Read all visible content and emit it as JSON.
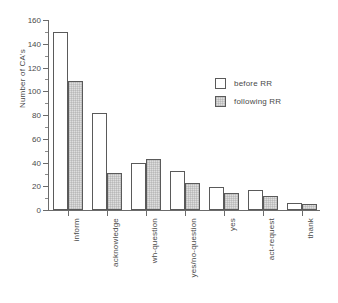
{
  "chart_data": {
    "type": "bar",
    "title": "",
    "xlabel": "",
    "ylabel": "Number of CA's",
    "ylim": [
      0,
      160
    ],
    "ytick_step": 20,
    "yticks": [
      0,
      20,
      40,
      60,
      80,
      100,
      120,
      140,
      160
    ],
    "ytick_labels": [
      "0",
      "20",
      "40",
      "60",
      "80",
      "100",
      "120",
      "140",
      "160"
    ],
    "minor_tick_step": 10,
    "grid": false,
    "legend_position": "upper right",
    "categories": [
      "inform",
      "acknowledge",
      "wh-question",
      "yes/no-question",
      "yes",
      "act-request",
      "thank"
    ],
    "series": [
      {
        "name": "before RR",
        "color": "#ffffff",
        "values": [
          150,
          82,
          40,
          33,
          19,
          17,
          6
        ]
      },
      {
        "name": "following RR",
        "color": "#dedede",
        "values": [
          109,
          31,
          43,
          23,
          14,
          12,
          5
        ]
      }
    ]
  },
  "legend": {
    "items": [
      {
        "label": "before RR",
        "swatch": "white-square-outline"
      },
      {
        "label": "following RR",
        "swatch": "gray-square-outline"
      }
    ]
  },
  "colors": {
    "axis": "#6b6b6b",
    "text": "#4a4a4a",
    "bar_outline": "#5a5a5a",
    "bar_before_fill": "#ffffff",
    "bar_following_fill": "#dedede",
    "background": "#ffffff"
  }
}
